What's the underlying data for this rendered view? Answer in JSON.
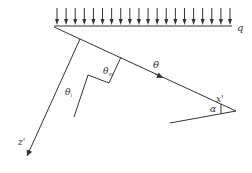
{
  "diagram": {
    "type": "mechanics-schematic",
    "colors": {
      "stroke": "#333333",
      "background": "#ffffff"
    },
    "load": {
      "label": "q",
      "arrow_count": 20,
      "x_start": 57,
      "x_end": 230,
      "arrow_top": 8,
      "baseline_y": 26
    },
    "labels": {
      "q": "q",
      "theta": "θ",
      "theta_m_base": "θ",
      "theta_m_sub": "m",
      "theta_i_base": "θ",
      "theta_i_sub": "i",
      "x_axis": "x'",
      "z_axis": "z'",
      "alpha": "α"
    }
  }
}
